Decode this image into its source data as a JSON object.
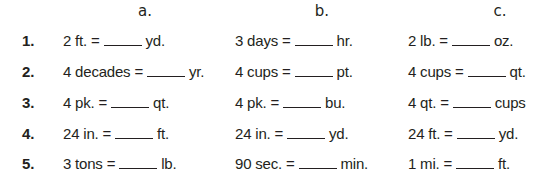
{
  "columns": [
    "a.",
    "b.",
    "c."
  ],
  "problems": [
    {
      "number": "1.",
      "a": {
        "left": "2 ft. =",
        "right": "yd."
      },
      "b": {
        "left": "3 days =",
        "right": "hr."
      },
      "c": {
        "left": "2 lb. =",
        "right": "oz."
      }
    },
    {
      "number": "2.",
      "a": {
        "left": "4 decades =",
        "right": "yr."
      },
      "b": {
        "left": "4 cups =",
        "right": "pt."
      },
      "c": {
        "left": "4 cups =",
        "right": "qt."
      }
    },
    {
      "number": "3.",
      "a": {
        "left": "4 pk. =",
        "right": "qt."
      },
      "b": {
        "left": "4 pk. =",
        "right": "bu."
      },
      "c": {
        "left": "4 qt. =",
        "right": "cups"
      }
    },
    {
      "number": "4.",
      "a": {
        "left": "24 in. =",
        "right": "ft."
      },
      "b": {
        "left": "24 in. =",
        "right": "yd."
      },
      "c": {
        "left": "24 ft. =",
        "right": "yd."
      }
    },
    {
      "number": "5.",
      "a": {
        "left": "3 tons =",
        "right": "lb."
      },
      "b": {
        "left": "90 sec. =",
        "right": "min."
      },
      "c": {
        "left": "1 mi. =",
        "right": "ft."
      }
    }
  ]
}
